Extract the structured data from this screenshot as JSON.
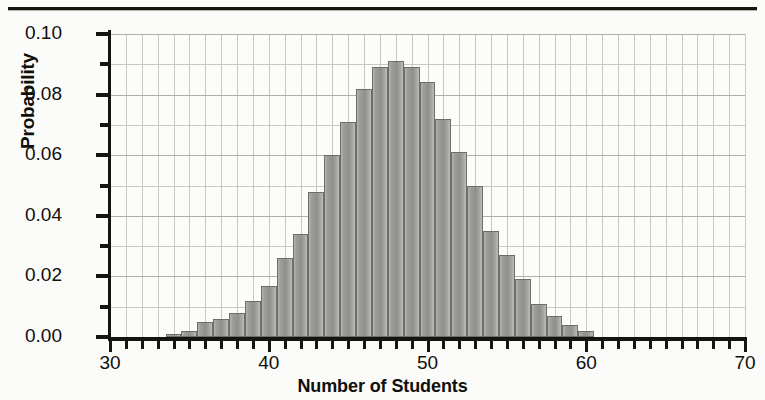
{
  "chart_data": {
    "type": "bar",
    "title": "",
    "subtitle": "",
    "xlabel": "Number of Students",
    "ylabel": "Probability",
    "xlim": [
      30,
      70
    ],
    "ylim": [
      0.0,
      0.1
    ],
    "grid": true,
    "legend": "none",
    "x_tick_labels": [
      "30",
      "40",
      "50",
      "60",
      "70"
    ],
    "x_tick_values": [
      30,
      40,
      50,
      60,
      70
    ],
    "x_minor_tick_step": 1,
    "y_tick_labels": [
      "0.00",
      "0.02",
      "0.04",
      "0.06",
      "0.08",
      "0.10"
    ],
    "y_tick_values": [
      0.0,
      0.02,
      0.04,
      0.06,
      0.08,
      0.1
    ],
    "y_minor_tick_step": 0.01,
    "bar_width_units": 1,
    "annotation": "Binomial-shaped probability distribution peaking near 48 students",
    "categories": [
      34,
      35,
      36,
      37,
      38,
      39,
      40,
      41,
      42,
      43,
      44,
      45,
      46,
      47,
      48,
      49,
      50,
      51,
      52,
      53,
      54,
      55,
      56,
      57,
      58,
      59,
      60
    ],
    "values": [
      0.001,
      0.002,
      0.005,
      0.006,
      0.008,
      0.012,
      0.017,
      0.026,
      0.034,
      0.048,
      0.06,
      0.071,
      0.082,
      0.089,
      0.091,
      0.089,
      0.084,
      0.072,
      0.061,
      0.05,
      0.035,
      0.027,
      0.019,
      0.011,
      0.007,
      0.004,
      0.002
    ]
  },
  "colors": {
    "bar_fill": "#9d9d9a",
    "bar_edge": "#6d6d6a",
    "axis": "#15140f",
    "grid": "#c9c9c4",
    "background": "#fbfbf9",
    "text": "#100f0b"
  }
}
